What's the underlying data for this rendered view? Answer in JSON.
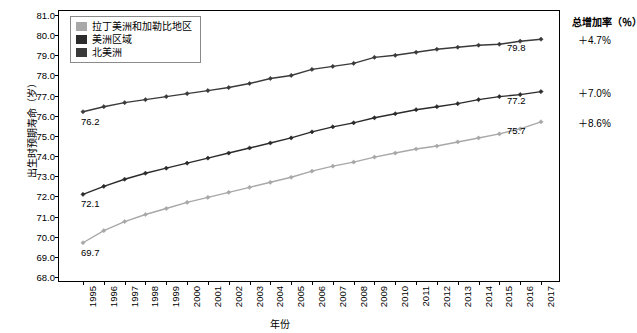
{
  "chart_data": {
    "type": "line",
    "title": "",
    "xlabel": "年份",
    "ylabel": "出生时预期寿命（岁）",
    "ylim": [
      68.0,
      81.0
    ],
    "yticks": [
      "68.0",
      "69.0",
      "70.0",
      "71.0",
      "72.0",
      "73.0",
      "74.0",
      "75.0",
      "76.0",
      "77.0",
      "78.0",
      "79.0",
      "80.0",
      "81.0"
    ],
    "grid": false,
    "legend_position": "top-left",
    "categories": [
      "1995",
      "1996",
      "1997",
      "1998",
      "1999",
      "2000",
      "2001",
      "2002",
      "2003",
      "2004",
      "2005",
      "2006",
      "2007",
      "2008",
      "2009",
      "2010",
      "2011",
      "2012",
      "2013",
      "2014",
      "2015",
      "2016",
      "2017"
    ],
    "series": [
      {
        "name": "北美洲",
        "color": "#3a3a3a",
        "values": [
          76.2,
          76.45,
          76.65,
          76.8,
          76.95,
          77.1,
          77.25,
          77.4,
          77.6,
          77.85,
          78.0,
          78.3,
          78.45,
          78.6,
          78.9,
          79.0,
          79.15,
          79.3,
          79.4,
          79.5,
          79.55,
          79.7,
          79.8
        ],
        "start_label": "76.2",
        "end_label": "79.8",
        "growth": "＋4.7%"
      },
      {
        "name": "美洲区域",
        "color": "#2b2b2b",
        "values": [
          72.1,
          72.5,
          72.85,
          73.15,
          73.4,
          73.65,
          73.9,
          74.15,
          74.4,
          74.65,
          74.9,
          75.2,
          75.45,
          75.65,
          75.9,
          76.1,
          76.3,
          76.45,
          76.6,
          76.8,
          76.95,
          77.05,
          77.2
        ],
        "start_label": "72.1",
        "end_label": "77.2",
        "growth": "＋7.0%"
      },
      {
        "name": "拉丁美洲和加勒比地区",
        "color": "#a8a8a8",
        "values": [
          69.7,
          70.3,
          70.75,
          71.1,
          71.4,
          71.7,
          71.95,
          72.2,
          72.45,
          72.7,
          72.95,
          73.25,
          73.5,
          73.7,
          73.95,
          74.15,
          74.35,
          74.5,
          74.7,
          74.9,
          75.1,
          75.35,
          75.7
        ],
        "start_label": "69.7",
        "end_label": "75.7",
        "growth": "＋8.6%"
      }
    ]
  },
  "legend": {
    "items": [
      {
        "label": "拉丁美洲和加勒比地区",
        "color": "#a8a8a8"
      },
      {
        "label": "美洲区域",
        "color": "#2b2b2b"
      },
      {
        "label": "北美洲",
        "color": "#3a3a3a"
      }
    ]
  },
  "annotations": {
    "title": "总增加率（％）",
    "items": [
      "＋4.7%",
      "＋7.0%",
      "＋8.6%"
    ]
  }
}
